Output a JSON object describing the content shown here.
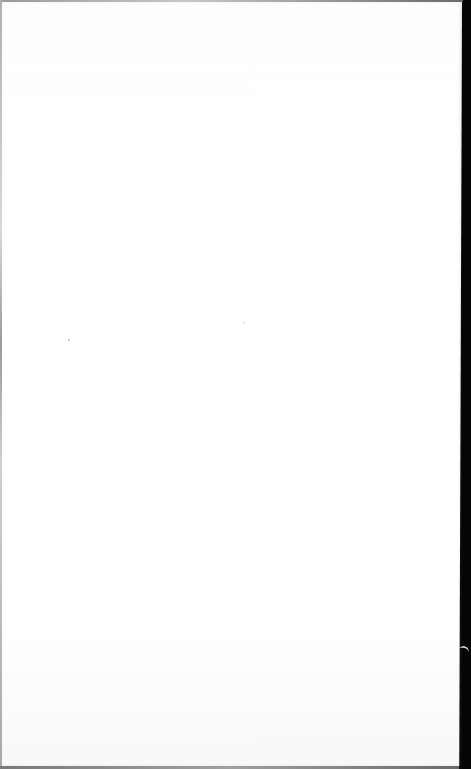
{
  "document": {
    "type": "blank-page-scan",
    "text": "",
    "colors": {
      "paper": "#ffffff",
      "border": "#050505",
      "edge": "#a0a0a0"
    },
    "marks": [
      {
        "x": 68,
        "y": 339
      },
      {
        "x": 243,
        "y": 322
      }
    ]
  }
}
